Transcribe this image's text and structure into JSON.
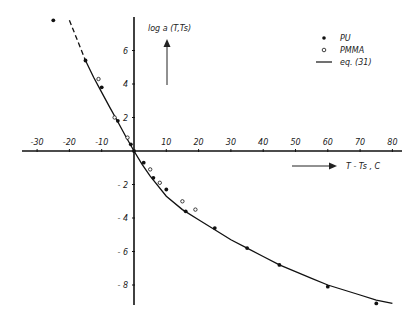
{
  "chart_data": {
    "type": "scatter",
    "title": "",
    "xlabel": "T - Ts , C",
    "ylabel": "log a (T,Ts)",
    "xlim": [
      -35,
      85
    ],
    "ylim": [
      -9.5,
      8
    ],
    "x_ticks": [
      -30,
      -20,
      -10,
      10,
      20,
      30,
      40,
      50,
      60,
      70,
      80
    ],
    "y_ticks": [
      6,
      4,
      2,
      -2,
      -4,
      -6,
      -8
    ],
    "grid": false,
    "legend_position": "upper right",
    "legend": [
      {
        "marker": "filled-circle",
        "label": "PU"
      },
      {
        "marker": "open-circle",
        "label": "PMMA"
      },
      {
        "marker": "line",
        "label": "eq.  (31)"
      }
    ],
    "series": [
      {
        "name": "PU",
        "marker": "filled-circle",
        "points": [
          [
            -25,
            7.8
          ],
          [
            -15,
            5.4
          ],
          [
            -10,
            3.8
          ],
          [
            -5,
            1.8
          ],
          [
            -1,
            0.4
          ],
          [
            0,
            0
          ],
          [
            3,
            -0.7
          ],
          [
            6,
            -1.6
          ],
          [
            10,
            -2.3
          ],
          [
            16,
            -3.6
          ],
          [
            25,
            -4.6
          ],
          [
            35,
            -5.8
          ],
          [
            45,
            -6.8
          ],
          [
            60,
            -8.1
          ],
          [
            75,
            -9.1
          ]
        ]
      },
      {
        "name": "PMMA",
        "marker": "open-circle",
        "points": [
          [
            -11,
            4.3
          ],
          [
            -6,
            2.0
          ],
          [
            -2,
            0.8
          ],
          [
            5,
            -1.1
          ],
          [
            8,
            -1.9
          ],
          [
            15,
            -3.0
          ],
          [
            19,
            -3.5
          ]
        ]
      },
      {
        "name": "eq. (31)",
        "type": "line",
        "dashed_below_x": -13,
        "points": [
          [
            -20,
            7.8
          ],
          [
            -17.5,
            6.6
          ],
          [
            -15,
            5.4
          ],
          [
            -12.5,
            4.4
          ],
          [
            -10,
            3.5
          ],
          [
            -7.5,
            2.6
          ],
          [
            -5,
            1.75
          ],
          [
            -2.5,
            0.85
          ],
          [
            0,
            0
          ],
          [
            2.5,
            -0.8
          ],
          [
            5,
            -1.5
          ],
          [
            10,
            -2.7
          ],
          [
            15,
            -3.5
          ],
          [
            20,
            -4.1
          ],
          [
            25,
            -4.7
          ],
          [
            30,
            -5.3
          ],
          [
            35,
            -5.8
          ],
          [
            40,
            -6.3
          ],
          [
            45,
            -6.8
          ],
          [
            50,
            -7.2
          ],
          [
            55,
            -7.6
          ],
          [
            60,
            -8.0
          ],
          [
            65,
            -8.3
          ],
          [
            70,
            -8.6
          ],
          [
            75,
            -8.9
          ],
          [
            80,
            -9.1
          ]
        ]
      }
    ]
  },
  "labels": {
    "y_axis": "log a (T,Ts)",
    "x_axis": "T - Ts , C",
    "legend_pu": "PU",
    "legend_pmma": "PMMA",
    "legend_eq": "eq.  (31)"
  }
}
